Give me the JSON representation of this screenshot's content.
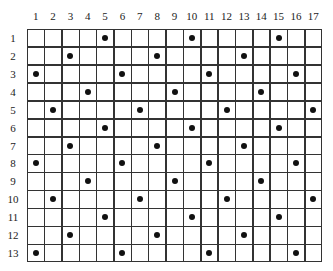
{
  "grid": {
    "columns": 17,
    "rows": 13,
    "column_labels": [
      "1",
      "2",
      "3",
      "4",
      "5",
      "6",
      "7",
      "8",
      "9",
      "10",
      "11",
      "12",
      "13",
      "14",
      "15",
      "16",
      "17"
    ],
    "row_labels": [
      "1",
      "2",
      "3",
      "4",
      "5",
      "6",
      "7",
      "8",
      "9",
      "10",
      "11",
      "12",
      "13"
    ],
    "line_color": "#333333",
    "dot_color": "#111111",
    "dots": [
      {
        "row": 1,
        "cols": [
          5,
          10,
          15
        ]
      },
      {
        "row": 2,
        "cols": [
          3,
          8,
          13
        ]
      },
      {
        "row": 3,
        "cols": [
          1,
          6,
          11,
          16
        ]
      },
      {
        "row": 4,
        "cols": [
          4,
          9,
          14
        ]
      },
      {
        "row": 5,
        "cols": [
          2,
          7,
          12,
          17
        ]
      },
      {
        "row": 6,
        "cols": [
          5,
          10,
          15
        ]
      },
      {
        "row": 7,
        "cols": [
          3,
          8,
          13
        ]
      },
      {
        "row": 8,
        "cols": [
          1,
          6,
          11,
          16
        ]
      },
      {
        "row": 9,
        "cols": [
          4,
          9,
          14
        ]
      },
      {
        "row": 10,
        "cols": [
          2,
          7,
          12,
          17
        ]
      },
      {
        "row": 11,
        "cols": [
          5,
          10,
          15
        ]
      },
      {
        "row": 12,
        "cols": [
          3,
          8,
          13
        ]
      },
      {
        "row": 13,
        "cols": [
          1,
          6,
          11,
          16
        ]
      }
    ]
  }
}
